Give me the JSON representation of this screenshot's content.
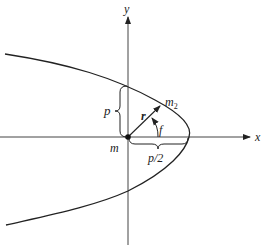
{
  "diagram": {
    "type": "parabolic orbit",
    "axes": {
      "x_label": "x",
      "y_label": "y"
    },
    "labels": {
      "origin_mass": "m",
      "orbiting_mass": "m",
      "orbiting_mass_subscript": "2",
      "radius_vector": "r",
      "true_anomaly": "f",
      "semi_latus_rectum": "p",
      "vertex_distance": "p/2"
    },
    "colors": {
      "stroke": "#222222",
      "background": "#ffffff"
    }
  }
}
